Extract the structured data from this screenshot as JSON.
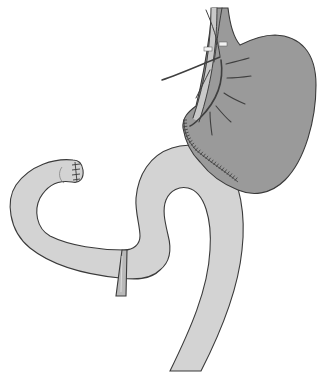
{
  "figure": {
    "title": "",
    "colors": {
      "background": "#ffffff",
      "stomach_fill": "#9a9a9a",
      "intestine_fill": "#d3d3d3",
      "outline": "#3a3a3a",
      "vessel_light": "#c9c9c9",
      "ligature_fill": "#b9b9b9"
    },
    "parts": [
      {
        "id": "stomach",
        "label": ""
      },
      {
        "id": "vascular-pedicle",
        "label": ""
      },
      {
        "id": "anastomosis-staple-line",
        "label": ""
      },
      {
        "id": "intestinal-limb",
        "label": ""
      },
      {
        "id": "blind-end-staples",
        "label": ""
      },
      {
        "id": "ligature-band",
        "label": ""
      }
    ]
  }
}
